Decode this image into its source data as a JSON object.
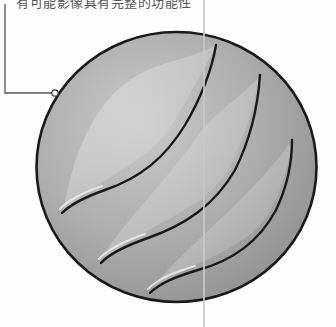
{
  "caption": {
    "text": "有可能影像具有完整的功能性"
  },
  "illustration": {
    "subject": "sphere with three curved swoosh grooves",
    "fill_color": "#a9a9a9",
    "highlight_color": "#dcdcdc",
    "outline_color": "#1a1a1a",
    "groove_count": 3
  },
  "callout": {
    "line_color": "#555555",
    "anchor_dot": "hollow-circle"
  },
  "divider": {
    "color": "#c8c8c8"
  }
}
